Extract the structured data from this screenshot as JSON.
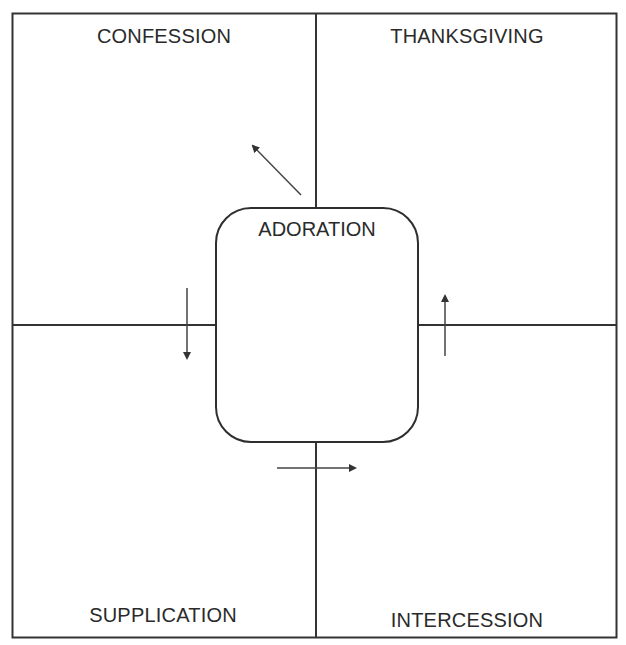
{
  "diagram": {
    "type": "quadrant-with-center",
    "colors": {
      "background": "#ffffff",
      "line": "#333333",
      "text": "#2a2a2a",
      "arrow": "#444444"
    },
    "quadrants": {
      "top_left": {
        "label": "CONFESSION"
      },
      "top_right": {
        "label": "THANKSGIVING"
      },
      "bottom_left": {
        "label": "SUPPLICATION"
      },
      "bottom_right": {
        "label": "INTERCESSION"
      }
    },
    "center": {
      "label": "ADORATION"
    },
    "arrows": [
      {
        "name": "arrow-center-to-confession",
        "direction": "up-left",
        "from": "ADORATION",
        "to": "CONFESSION"
      },
      {
        "name": "arrow-confession-to-supplication",
        "direction": "down",
        "from": "CONFESSION",
        "to": "SUPPLICATION"
      },
      {
        "name": "arrow-supplication-to-intercession",
        "direction": "right",
        "from": "SUPPLICATION",
        "to": "INTERCESSION"
      },
      {
        "name": "arrow-intercession-to-thanksgiving",
        "direction": "up",
        "from": "INTERCESSION",
        "to": "THANKSGIVING"
      }
    ]
  }
}
